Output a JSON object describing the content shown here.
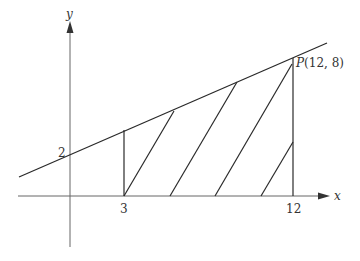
{
  "diagram": {
    "type": "coordinate-geometry",
    "axes": {
      "x_label": "x",
      "y_label": "y",
      "x_ticks": [
        {
          "value": 3,
          "label": "3"
        },
        {
          "value": 12,
          "label": "12"
        }
      ],
      "y_intercept_label": "2"
    },
    "line": {
      "description": "Straight line with y-intercept 2 passing through P(12, 8)",
      "y_intercept": 2,
      "slope": 0.5
    },
    "point": {
      "name": "P",
      "label": "P(12, 8)",
      "x": 12,
      "y": 8
    },
    "shaded_region": {
      "description": "Hatched trapezoid bounded by the line, x-axis, x=3 and x=12",
      "x_from": 3,
      "x_to": 12
    },
    "labels": {
      "x_axis": "x",
      "y_axis": "y",
      "tick_3": "3",
      "tick_12": "12",
      "intercept": "2",
      "point_name": "P",
      "point_coords": "(12, 8)"
    },
    "colors": {
      "line": "#2a2a2a",
      "axis": "#555555",
      "background": "#ffffff"
    }
  }
}
